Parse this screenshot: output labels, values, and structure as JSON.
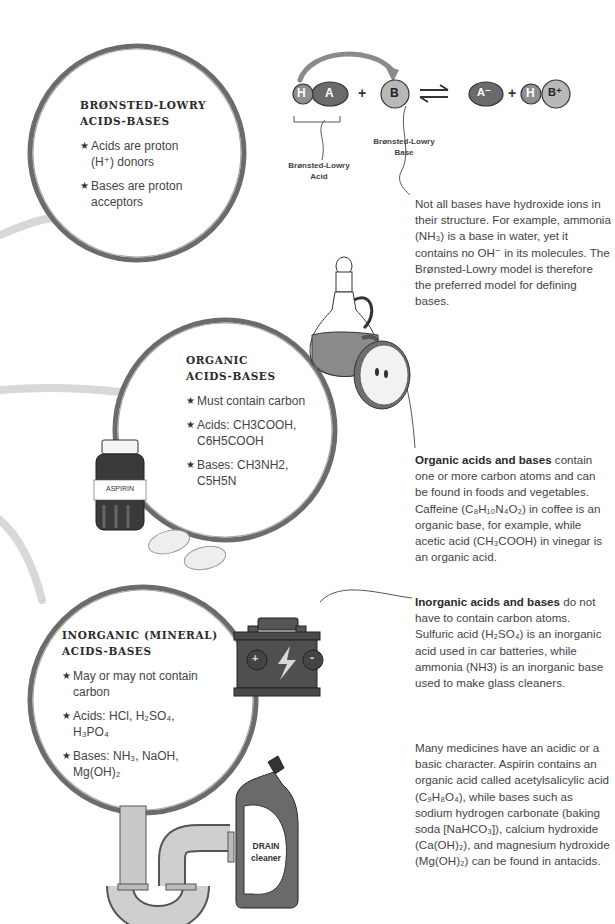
{
  "bronsted": {
    "title_line1": "BRØNSTED-LOWRY",
    "title_line2": "ACIDS-BASES",
    "bullets": [
      {
        "icon": "star-icon",
        "text": "Acids are proton (H⁺) donors"
      },
      {
        "icon": "star-icon",
        "text": "Bases are proton acceptors"
      }
    ]
  },
  "reaction": {
    "acid_h": "H",
    "acid_a": "A",
    "plus1": "+",
    "base_b": "B",
    "equilibrium_symbol": "⇌",
    "conj_base": "A⁻",
    "plus2": "+",
    "conj_acid_h": "H",
    "conj_acid_b": "B⁺",
    "acid_label_line1": "Brønsted-Lowry",
    "acid_label_line2": "Acid",
    "base_label_line1": "Brønsted-Lowry",
    "base_label_line2": "Base"
  },
  "bronsted_note": {
    "text": "Not all bases have hydroxide ions in their structure. For example, ammonia (NH₃) is a base in water, yet it contains no OH⁻ in its molecules. The Brønsted-Lowry model is therefore the preferred model for defining bases."
  },
  "organic": {
    "title_line1": "ORGANIC",
    "title_line2": "ACIDS-BASES",
    "bullets": [
      {
        "icon": "star-icon",
        "text": "Must contain carbon"
      },
      {
        "icon": "star-icon",
        "text": "Acids: CH3COOH, C6H5COOH"
      },
      {
        "icon": "star-icon",
        "text": "Bases: CH3NH2, C5H5N"
      }
    ],
    "bottle_label": "ASPIRIN"
  },
  "organic_note": {
    "bold": "Organic acids and bases",
    "text": " contain one or more carbon atoms and can be found in foods and vegetables. Caffeine (C₈H₁₀N₄O₂) in coffee is an organic base, for example, while acetic acid (CH₃COOH) in vinegar is an organic acid."
  },
  "inorganic": {
    "title_line1": "INORGANIC (MINERAL)",
    "title_line2": "ACIDS-BASES",
    "bullets": [
      {
        "icon": "star-icon",
        "text": "May or may not contain carbon"
      },
      {
        "icon": "star-icon",
        "text": "Acids: HCl, H₂SO₄, H₃PO₄"
      },
      {
        "icon": "star-icon",
        "text": "Bases: NH₃, NaOH, Mg(OH)₂"
      }
    ],
    "battery_plus": "+",
    "battery_minus": "-",
    "drain_label_line1": "DRAIN",
    "drain_label_line2": "cleaner"
  },
  "inorganic_note": {
    "bold": "Inorganic acids and bases",
    "text": " do not have to contain carbon atoms. Sulfuric acid (H₂SO₄) is an inorganic acid used in car batteries, while ammonia (NH3) is an inorganic base used to make glass cleaners."
  },
  "medicine_note": {
    "text": "Many medicines have an acidic or a basic character. Aspirin contains an organic acid called acetylsalicylic acid (C₉H₈O₄), while bases such as sodium hydrogen carbonate (baking soda [NaHCO₃]), calcium hydroxide (Ca(OH)₂), and magnesium hydroxide (Mg(OH)₂) can be found in antacids."
  },
  "colors": {
    "ring": "#5e5e5e",
    "ring_light": "#8a8a8a",
    "swoosh": "#d6d6d6",
    "arrow": "#8c8c8c",
    "atom_dark": "#6a6a6a",
    "atom_light": "#b3b3b3",
    "text": "#444444"
  }
}
